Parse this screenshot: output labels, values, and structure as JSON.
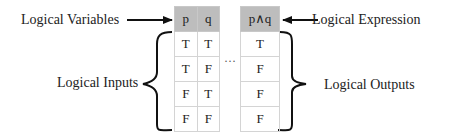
{
  "labels": {
    "logical_variables": "Logical Variables",
    "logical_expression": "Logical Expression",
    "logical_inputs": "Logical Inputs",
    "logical_outputs": "Logical Outputs"
  },
  "inputs_table": {
    "headers": [
      "p",
      "q"
    ],
    "rows": [
      [
        "T",
        "T"
      ],
      [
        "T",
        "F"
      ],
      [
        "F",
        "T"
      ],
      [
        "F",
        "F"
      ]
    ]
  },
  "outputs_table": {
    "header": "p∧q",
    "rows": [
      "T",
      "F",
      "F",
      "F"
    ]
  },
  "ellipsis": "···",
  "colors": {
    "header_bg": "#bdbdbd",
    "border": "#d4d4d4",
    "ink": "#111111"
  }
}
